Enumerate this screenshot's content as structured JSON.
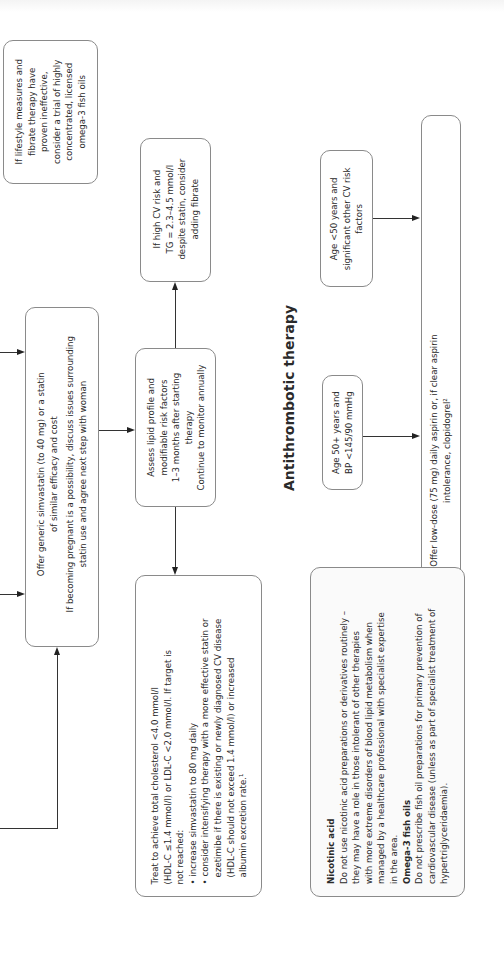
{
  "page": {
    "section_title": "Antithrombotic therapy"
  },
  "flowchart": {
    "fish_oil_box": "If lifestyle measures and fibrate therapy have proven ineffective, consider a trial of highly concentrated, licensed omega-3 fish oils",
    "fish_oil_lines": [
      "If lifestyle measures and",
      "fibrate therapy have",
      "proven ineffective,",
      "consider a trial of highly",
      "concentrated, licensed",
      "omega-3 fish oils"
    ],
    "statin_box_lines": [
      "Offer generic simvastatin (to 40 mg) or a statin",
      "of similar efficacy and cost",
      "If becoming pregnant is a possibility, discuss issues surrounding",
      "statin use and agree next step with woman"
    ],
    "tg_box_lines": [
      "If high CV risk and",
      "TG = 2.3–4.5 mmol/l",
      "despite statin, consider",
      "adding fibrate"
    ],
    "assess_box_lines": [
      "Assess lipid profile and",
      "modifiable risk factors",
      "1–3 months after starting",
      "therapy",
      "Continue to monitor annually"
    ],
    "treat_box_lines": [
      "Treat to achieve total cholesterol <4.0 mmol/l",
      "(HDL-C ≤1.4 mmol/l) or LDL-C <2.0 mmol/l. If target is",
      "not reached:",
      "• increase simvastatin to 80 mg daily",
      "• consider intensifying therapy with a more effective statin or",
      "  ezetimibe if there is existing or newly diagnosed CV disease",
      "  (HDL-C should not exceed 1.4 mmol/l) or increased",
      "  albumin excretion rate.¹"
    ]
  },
  "antithrombotic": {
    "age_under50_lines": [
      "Age <50 years and",
      "significant other CV risk",
      "factors"
    ],
    "age_50plus_lines": [
      "Age 50+ years and",
      "BP <145/90 mmHg"
    ],
    "offer_aspirin_lines": [
      "Offer low-dose (75 mg) daily aspirin or, if clear aspirin",
      "intolerance, clopidogrel²"
    ]
  },
  "notes": {
    "nicotinic_heading": "Nicotinic acid",
    "nicotinic_lines": [
      "Do not use nicotinic acid preparations or derivatives routinely –",
      "they may have a role in those intolerant of other therapies",
      "with more extreme disorders of blood lipid metabolism when",
      "managed by a healthcare professional with specialist expertise",
      "in the area."
    ],
    "omega_heading": "Omega-3 fish oils",
    "omega_lines": [
      "Do not prescribe fish oil preparations for primary prevention of",
      "cardiovascular disease (unless as part of specialist treatment of",
      "hypertriglyceridaemia)."
    ]
  },
  "colors": {
    "border": "#8a8a8a",
    "text": "#2a2a2a",
    "arrow": "#222222"
  }
}
